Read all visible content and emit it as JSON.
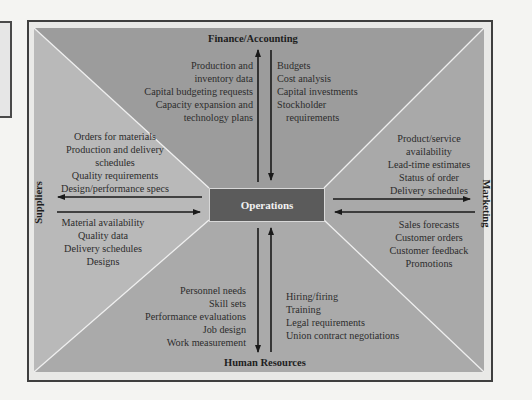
{
  "diagram": {
    "center": {
      "label": "Operations",
      "color": "#5b5b5b"
    },
    "departments": {
      "finance": {
        "label": "Finance/Accounting",
        "to_department": [
          "Production and",
          "inventory data",
          "Capital budgeting requests",
          "Capacity expansion and",
          "technology plans"
        ],
        "from_department": [
          "Budgets",
          "Cost analysis",
          "Capital investments",
          "Stockholder",
          "requirements"
        ]
      },
      "suppliers": {
        "label": "Suppliers",
        "to_department": [
          "Orders for materials",
          "Production and delivery",
          "schedules",
          "Quality requirements",
          "Design/performance specs"
        ],
        "from_department": [
          "Material availability",
          "Quality data",
          "Delivery schedules",
          "Designs"
        ]
      },
      "marketing": {
        "label": "Marketing",
        "to_department": [
          "Product/service",
          "availability",
          "Lead-time estimates",
          "Status of order",
          "Delivery schedules"
        ],
        "from_department": [
          "Sales forecasts",
          "Customer orders",
          "Customer feedback",
          "Promotions"
        ]
      },
      "human_resources": {
        "label": "Human Resources",
        "to_department": [
          "Personnel needs",
          "Skill sets",
          "Performance evaluations",
          "Job design",
          "Work measurement"
        ],
        "from_department": [
          "Hiring/firing",
          "Training",
          "Legal requirements",
          "Union contract negotiations"
        ]
      }
    },
    "colors": {
      "finance_panel": "#9c9c9c",
      "suppliers_panel": "#b9b9b9",
      "marketing_panel": "#a9a9a9",
      "hr_panel": "#aaaaaa",
      "frame_border": "#3f3f3f",
      "arrow": "#1a1a1a"
    }
  }
}
